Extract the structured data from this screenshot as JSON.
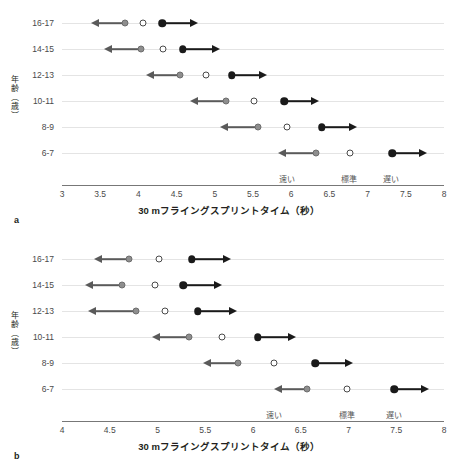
{
  "figure": {
    "axis_y_title": "年齢（歳）",
    "axis_x_title": "30 mフライングスプリントタイム（秒）",
    "zone_labels": [
      "速い",
      "標準",
      "遅い"
    ]
  },
  "panels": [
    {
      "letter": "a",
      "xlabels": [
        "3",
        "3.5",
        "4",
        "4.5",
        "5",
        "5.5",
        "6",
        "6.5",
        "7",
        "7.5",
        "8"
      ],
      "ylabels": [
        "16-17",
        "14-15",
        "12-13",
        "10-11",
        "8-9",
        "6-7"
      ],
      "zone_positions": [
        5.95,
        6.75,
        7.3
      ]
    },
    {
      "letter": "b",
      "xlabels": [
        "4",
        "4.5",
        "5",
        "5.5",
        "6",
        "6.5",
        "7",
        "7.5",
        "8"
      ],
      "ylabels": [
        "16-17",
        "14-15",
        "12-13",
        "10-11",
        "8-9",
        "6-7"
      ],
      "zone_positions": [
        6.22,
        6.98,
        7.48
      ]
    }
  ],
  "chart_data": [
    {
      "type": "scatter",
      "panel": "a",
      "title": "a",
      "xlabel": "30 mフライングスプリントタイム（秒）",
      "ylabel": "年齢（歳）",
      "xlim": [
        3,
        8
      ],
      "xticks": [
        3,
        3.5,
        4,
        4.5,
        5,
        5.5,
        6,
        6.5,
        7,
        7.5,
        8
      ],
      "categories": [
        "16-17",
        "14-15",
        "12-13",
        "10-11",
        "8-9",
        "6-7"
      ],
      "grid": true,
      "legend": [
        "速い",
        "標準",
        "遅い"
      ],
      "series": [
        {
          "name": "速い (fast cut-off, gray filled)",
          "values": [
            3.83,
            4.03,
            4.55,
            5.15,
            5.56,
            6.33
          ]
        },
        {
          "name": "標準 (standard mean, open)",
          "values": [
            4.06,
            4.32,
            4.88,
            5.51,
            5.95,
            6.77
          ]
        },
        {
          "name": "遅い (slow cut-off, black filled)",
          "values": [
            4.31,
            4.58,
            5.22,
            5.91,
            6.4,
            7.32
          ]
        }
      ],
      "left_arrow_ends": [
        3.38,
        3.55,
        4.1,
        4.67,
        5.07,
        5.83
      ],
      "right_arrow_ends": [
        4.78,
        5.07,
        5.68,
        6.37,
        6.86,
        7.78
      ]
    },
    {
      "type": "scatter",
      "panel": "b",
      "title": "b",
      "xlabel": "30 mフライングスプリントタイム（秒）",
      "ylabel": "年齢（歳）",
      "xlim": [
        4,
        8
      ],
      "xticks": [
        4,
        4.5,
        5,
        5.5,
        6,
        6.5,
        7,
        7.5,
        8
      ],
      "categories": [
        "16-17",
        "14-15",
        "12-13",
        "10-11",
        "8-9",
        "6-7"
      ],
      "grid": true,
      "legend": [
        "速い",
        "標準",
        "遅い"
      ],
      "series": [
        {
          "name": "速い (fast cut-off, gray filled)",
          "values": [
            4.7,
            4.63,
            4.78,
            5.33,
            5.84,
            6.57
          ]
        },
        {
          "name": "標準 (standard mean, open)",
          "values": [
            5.02,
            4.97,
            5.08,
            5.68,
            6.22,
            6.98
          ]
        },
        {
          "name": "遅い (slow cut-off, black filled)",
          "values": [
            5.36,
            5.27,
            5.42,
            6.05,
            6.65,
            7.48
          ]
        }
      ],
      "left_arrow_ends": [
        4.33,
        4.24,
        4.27,
        4.94,
        5.48,
        6.22
      ],
      "right_arrow_ends": [
        5.77,
        5.68,
        5.83,
        6.45,
        7.05,
        7.84
      ]
    }
  ]
}
